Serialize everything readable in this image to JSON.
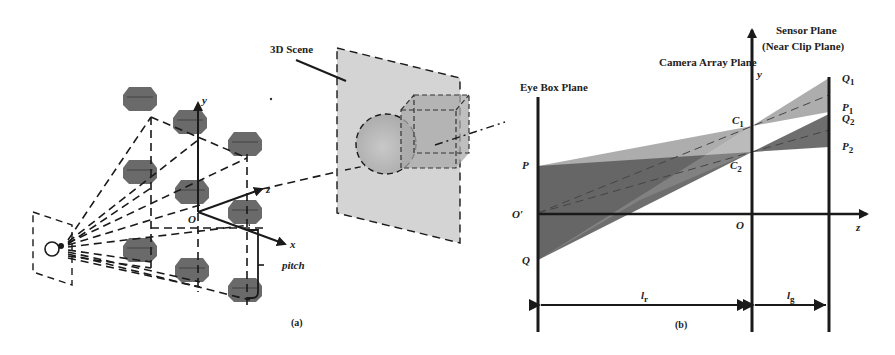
{
  "figure": {
    "panel_a": {
      "caption": "(a)",
      "scene_label": "3D Scene",
      "axis_labels": {
        "x": "x",
        "y": "y",
        "z": "z",
        "origin": "O"
      },
      "pitch_label": "pitch",
      "camera_grid": {
        "rows": 3,
        "cols": 3
      }
    },
    "panel_b": {
      "caption": "(b)",
      "planes": {
        "eye_box": "Eye Box Plane",
        "camera_array": "Camera Array Plane",
        "sensor_line1": "Sensor Plane",
        "sensor_line2": "(Near Clip Plane)"
      },
      "axis_labels": {
        "y": "y",
        "z": "z",
        "origin": "O",
        "origin_prime": "O′"
      },
      "points": {
        "P": "P",
        "Q": "Q",
        "C1": {
          "base": "C",
          "sub": "1"
        },
        "C2": {
          "base": "C",
          "sub": "2"
        },
        "Q1": {
          "base": "Q",
          "sub": "1"
        },
        "P1": {
          "base": "P",
          "sub": "1"
        },
        "Q2": {
          "base": "Q",
          "sub": "2"
        },
        "P2": {
          "base": "P",
          "sub": "2"
        }
      },
      "dimensions": {
        "lr": {
          "base": "l",
          "sub": "r"
        },
        "lg": {
          "base": "l",
          "sub": "g"
        }
      }
    },
    "colors": {
      "line": "#1a1a1a",
      "camera_block": "#5a5a5a",
      "scene_plane": "#d4d4d4",
      "light_frustum": "#9a9a9a",
      "dark_frustum": "#5c5c5c",
      "sphere": "#bdbdbd",
      "cube": "#a8a8a8"
    }
  }
}
